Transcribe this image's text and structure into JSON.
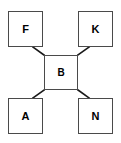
{
  "diagram": {
    "type": "node-link-diagram",
    "background_color": "#ffffff",
    "node_border_color": "#4a4a4a",
    "edge_color": "#1a1a1a",
    "label_color": "#000000",
    "nodes": [
      {
        "id": "F",
        "label": "F",
        "position": "top-left",
        "x": 8,
        "y": 11,
        "w": 35,
        "h": 36
      },
      {
        "id": "K",
        "label": "K",
        "position": "top-right",
        "x": 78,
        "y": 11,
        "w": 35,
        "h": 36
      },
      {
        "id": "B",
        "label": "B",
        "position": "center",
        "x": 44,
        "y": 55,
        "w": 34,
        "h": 35
      },
      {
        "id": "A",
        "label": "A",
        "position": "bottom-left",
        "x": 8,
        "y": 98,
        "w": 35,
        "h": 36
      },
      {
        "id": "N",
        "label": "N",
        "position": "bottom-right",
        "x": 78,
        "y": 98,
        "w": 35,
        "h": 36
      }
    ],
    "edges": [
      {
        "from": "B",
        "to": "F",
        "x1": 44,
        "y1": 55,
        "x2": 33,
        "y2": 47
      },
      {
        "from": "B",
        "to": "K",
        "x1": 78,
        "y1": 55,
        "x2": 89,
        "y2": 47
      },
      {
        "from": "B",
        "to": "A",
        "x1": 44,
        "y1": 90,
        "x2": 33,
        "y2": 98
      },
      {
        "from": "B",
        "to": "N",
        "x1": 78,
        "y1": 90,
        "x2": 89,
        "y2": 98
      }
    ]
  }
}
